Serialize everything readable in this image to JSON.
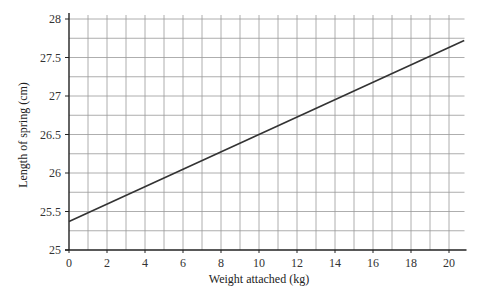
{
  "chart_data": {
    "type": "line",
    "title": "",
    "xlabel": "Weight attached (kg)",
    "ylabel": "Length of spring (cm)",
    "xlim": [
      0,
      20.5
    ],
    "ylim": [
      25,
      28
    ],
    "x_ticks": [
      0,
      2,
      4,
      6,
      8,
      10,
      12,
      14,
      16,
      18,
      20
    ],
    "y_ticks": [
      25,
      25.5,
      26,
      26.5,
      27,
      27.5,
      28
    ],
    "x_tick_labels": [
      "0",
      "2",
      "4",
      "6",
      "8",
      "10",
      "12",
      "14",
      "16",
      "18",
      "20"
    ],
    "y_tick_labels": [
      "25",
      "25.5",
      "26",
      "26.5",
      "27",
      "27.5",
      "28"
    ],
    "grid": true,
    "grid_minor_x_step": 1,
    "grid_minor_y_step": 0.25,
    "legend": null,
    "series": [
      {
        "name": "spring length",
        "x": [
          0,
          20.8
        ],
        "y": [
          25.37,
          27.72
        ]
      }
    ],
    "colors": {
      "line": "#333333",
      "grid": "#999999",
      "axis": "#222222"
    }
  }
}
